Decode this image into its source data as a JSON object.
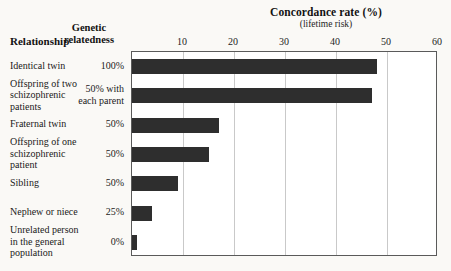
{
  "chart_data": {
    "type": "bar",
    "orientation": "horizontal",
    "title": "Concordance rate (%)",
    "subtitle": "(lifetime risk)",
    "xlabel": "Concordance rate (%)",
    "ylabel": "Relationship",
    "xlim": [
      0,
      60
    ],
    "xticks": [
      10,
      20,
      30,
      40,
      50,
      60
    ],
    "grid": true,
    "legend": false,
    "categories": [
      "Identical twin",
      "Offspring of two schizophrenic patients",
      "Fraternal twin",
      "Offspring of one schizophrenic patient",
      "Sibling",
      "Nephew or niece",
      "Unrelated person in the general population"
    ],
    "values": [
      48,
      47,
      17,
      15,
      9,
      4,
      1
    ],
    "annotations": {
      "genetic_relatedness": [
        "100%",
        "50% with each parent",
        "50%",
        "50%",
        "50%",
        "25%",
        "0%"
      ]
    },
    "series": [
      {
        "name": "Concordance rate (%)",
        "values": [
          48,
          47,
          17,
          15,
          9,
          4,
          1
        ]
      }
    ]
  },
  "columns": {
    "relationship_header": "Relationship",
    "relatedness_header_line1": "Genetic",
    "relatedness_header_line2": "relatedness"
  },
  "rows": [
    {
      "label_lines": [
        "Identical twin"
      ],
      "relatedness_lines": [
        "100%"
      ],
      "value": 48
    },
    {
      "label_lines": [
        "Offspring of two",
        "schizophrenic",
        "patients"
      ],
      "relatedness_lines": [
        "50% with",
        "each parent"
      ],
      "value": 47
    },
    {
      "label_lines": [
        "Fraternal twin"
      ],
      "relatedness_lines": [
        "50%"
      ],
      "value": 17
    },
    {
      "label_lines": [
        "Offspring of one",
        "schizophrenic",
        "patient"
      ],
      "relatedness_lines": [
        "50%"
      ],
      "value": 15
    },
    {
      "label_lines": [
        "Sibling"
      ],
      "relatedness_lines": [
        "50%"
      ],
      "value": 9
    },
    {
      "label_lines": [
        "Nephew or niece"
      ],
      "relatedness_lines": [
        "25%"
      ],
      "value": 4
    },
    {
      "label_lines": [
        "Unrelated person",
        "in the general",
        "population"
      ],
      "relatedness_lines": [
        "0%"
      ],
      "value": 1
    }
  ],
  "axis": {
    "ticks": [
      "10",
      "20",
      "30",
      "40",
      "50",
      "60"
    ]
  },
  "colors": {
    "bar": "#2e2e2e",
    "gridline": "#c9c9c9",
    "plot_border": "#5a5a5a",
    "background": "#faf9f6",
    "plot_background": "#ffffff",
    "text": "#1a1a1a"
  }
}
